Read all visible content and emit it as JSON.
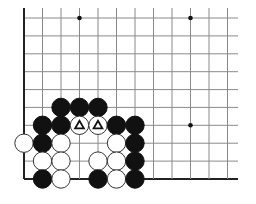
{
  "diagram": {
    "type": "go-board-corner",
    "grid": {
      "x_lines": [
        24,
        42.5,
        61,
        79.5,
        98,
        116.5,
        135,
        153.5,
        172,
        190.5,
        209,
        227.5
      ],
      "y_lines": [
        18,
        35.9,
        53.8,
        71.7,
        89.6,
        107.4,
        125.3,
        143.2,
        161.1,
        179
      ],
      "extend_right": 238,
      "extend_top": 8,
      "line_color": "#8a8a8a",
      "edge_color": "#222222"
    },
    "star_points": [
      {
        "col": 3,
        "row": 0
      },
      {
        "col": 9,
        "row": 0
      },
      {
        "col": 9,
        "row": 6
      }
    ],
    "stone_radius": 9.2,
    "stones": [
      {
        "color": "black",
        "col": 2,
        "row": 5
      },
      {
        "color": "black",
        "col": 3,
        "row": 5
      },
      {
        "color": "black",
        "col": 4,
        "row": 5
      },
      {
        "color": "black",
        "col": 1,
        "row": 6
      },
      {
        "color": "black",
        "col": 2,
        "row": 6
      },
      {
        "color": "white",
        "col": 3,
        "row": 6,
        "mark": "triangle"
      },
      {
        "color": "white",
        "col": 4,
        "row": 6,
        "mark": "triangle"
      },
      {
        "color": "black",
        "col": 5,
        "row": 6
      },
      {
        "color": "black",
        "col": 6,
        "row": 6
      },
      {
        "color": "white",
        "col": 0,
        "row": 7
      },
      {
        "color": "black",
        "col": 1,
        "row": 7
      },
      {
        "color": "white",
        "col": 2,
        "row": 7
      },
      {
        "color": "white",
        "col": 5,
        "row": 7
      },
      {
        "color": "black",
        "col": 6,
        "row": 7
      },
      {
        "color": "white",
        "col": 1,
        "row": 8
      },
      {
        "color": "white",
        "col": 2,
        "row": 8
      },
      {
        "color": "white",
        "col": 4,
        "row": 8
      },
      {
        "color": "white",
        "col": 5,
        "row": 8
      },
      {
        "color": "black",
        "col": 6,
        "row": 8
      },
      {
        "color": "black",
        "col": 1,
        "row": 9
      },
      {
        "color": "white",
        "col": 2,
        "row": 9
      },
      {
        "color": "black",
        "col": 4,
        "row": 9
      },
      {
        "color": "white",
        "col": 5,
        "row": 9
      },
      {
        "color": "black",
        "col": 6,
        "row": 9
      }
    ],
    "mark_glyph": "△"
  }
}
